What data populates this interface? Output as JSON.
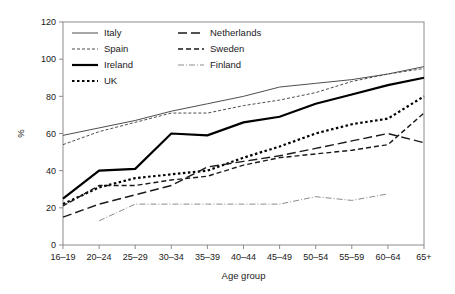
{
  "chart_data": {
    "type": "line",
    "title": "",
    "xlabel": "Age group",
    "ylabel": "%",
    "categories": [
      "16–19",
      "20–24",
      "25–29",
      "30–34",
      "35–39",
      "40–44",
      "45–49",
      "50–54",
      "55–59",
      "60–64",
      "65+"
    ],
    "ylim": [
      0,
      120
    ],
    "yticks": [
      0,
      20,
      40,
      60,
      80,
      100,
      120
    ],
    "ytick_labels": [
      "0",
      "20",
      "40",
      "60",
      "80",
      "100",
      "120"
    ],
    "grid": false,
    "legend_position": "top-left-inside",
    "series": [
      {
        "name": "Italy",
        "style": "thin-solid",
        "color": "#4d4d4d",
        "width": 1,
        "dash": "none",
        "values": [
          59,
          63,
          67,
          72,
          76,
          80,
          85,
          87,
          89,
          92,
          96
        ]
      },
      {
        "name": "Spain",
        "style": "fine-dashed",
        "color": "#4d4d4d",
        "width": 1,
        "dash": "3,2",
        "values": [
          54,
          61,
          66,
          71,
          71,
          75,
          78,
          82,
          88,
          92,
          95
        ]
      },
      {
        "name": "Ireland",
        "style": "thick-solid",
        "color": "#000000",
        "width": 2.2,
        "dash": "none",
        "values": [
          25,
          40,
          41,
          60,
          59,
          66,
          69,
          76,
          81,
          86,
          90
        ]
      },
      {
        "name": "UK",
        "style": "thick-dotted",
        "color": "#000000",
        "width": 2.2,
        "dash": "2.5,2.5",
        "values": [
          22,
          31,
          36,
          38,
          40,
          47,
          53,
          60,
          65,
          68,
          80
        ]
      },
      {
        "name": "Netherlands",
        "style": "long-dash",
        "color": "#1a1a1a",
        "width": 1.4,
        "dash": "9,4",
        "values": [
          15,
          22,
          27,
          32,
          42,
          45,
          48,
          52,
          56,
          60,
          55
        ]
      },
      {
        "name": "Sweden",
        "style": "medium-dash",
        "color": "#1a1a1a",
        "width": 1.4,
        "dash": "5,3",
        "values": [
          21,
          32,
          32,
          35,
          37,
          43,
          47,
          49,
          51,
          54,
          71
        ]
      },
      {
        "name": "Finland",
        "style": "dash-dot-light",
        "color": "#8c8c8c",
        "width": 1,
        "dash": "6,2,1,2",
        "values": [
          null,
          13,
          22,
          22,
          22,
          22,
          22,
          26,
          24,
          27.5,
          null
        ]
      }
    ]
  },
  "legend": {
    "entries": [
      {
        "label": "Italy",
        "column": 0
      },
      {
        "label": "Spain",
        "column": 0
      },
      {
        "label": "Ireland",
        "column": 0
      },
      {
        "label": "UK",
        "column": 0
      },
      {
        "label": "Netherlands",
        "column": 1
      },
      {
        "label": "Sweden",
        "column": 1
      },
      {
        "label": "Finland",
        "column": 1
      }
    ]
  }
}
